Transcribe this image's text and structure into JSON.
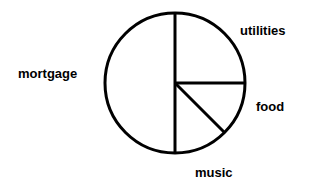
{
  "chart_data": {
    "type": "pie",
    "title": "",
    "subtitle": "",
    "xlabel": "",
    "ylabel": "",
    "grid": false,
    "legend_position": "none",
    "label_placement": "outside",
    "start_angle_deg": 90,
    "direction": "clockwise",
    "stroke_color": "#000000",
    "stroke_width": 3,
    "fill_color": "#ffffff",
    "background_color": "#ffffff",
    "center": {
      "x": 175,
      "y": 83
    },
    "radius": 70,
    "categories": [
      "utilities",
      "food",
      "music",
      "mortgage"
    ],
    "values": [
      25,
      12.5,
      12.5,
      50
    ],
    "slices": [
      {
        "label": "utilities",
        "value": 25,
        "angle_deg": 90,
        "start_deg": 0,
        "end_deg": 90,
        "label_x": 240,
        "label_y": 23
      },
      {
        "label": "food",
        "value": 12.5,
        "angle_deg": 45,
        "start_deg": 90,
        "end_deg": 135,
        "label_x": 256,
        "label_y": 99
      },
      {
        "label": "music",
        "value": 12.5,
        "angle_deg": 45,
        "start_deg": 135,
        "end_deg": 180,
        "label_x": 195,
        "label_y": 165
      },
      {
        "label": "mortgage",
        "value": 50,
        "angle_deg": 180,
        "start_deg": 180,
        "end_deg": 360,
        "label_x": 18,
        "label_y": 66
      }
    ]
  },
  "labels": {
    "mortgage": "mortgage",
    "utilities": "utilities",
    "food": "food",
    "music": "music"
  }
}
